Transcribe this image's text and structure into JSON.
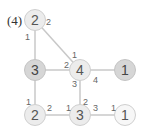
{
  "problem_label": "(4)",
  "nodes": [
    {
      "id": "top-left",
      "value": "2",
      "style": "light",
      "x": 35,
      "y": 20
    },
    {
      "id": "mid-left",
      "value": "3",
      "style": "dark",
      "x": 35,
      "y": 70
    },
    {
      "id": "center",
      "value": "4",
      "style": "light",
      "x": 80,
      "y": 70
    },
    {
      "id": "mid-right",
      "value": "1",
      "style": "dark",
      "x": 125,
      "y": 70
    },
    {
      "id": "bottom-left",
      "value": "2",
      "style": "light",
      "x": 35,
      "y": 115
    },
    {
      "id": "bottom-mid",
      "value": "3",
      "style": "light",
      "x": 80,
      "y": 115
    },
    {
      "id": "bottom-right",
      "value": "1",
      "style": "white",
      "x": 125,
      "y": 115
    }
  ],
  "edges": [
    {
      "from": "top-left",
      "to": "mid-left"
    },
    {
      "from": "top-left",
      "to": "center"
    },
    {
      "from": "mid-left",
      "to": "center"
    },
    {
      "from": "center",
      "to": "mid-right"
    },
    {
      "from": "mid-left",
      "to": "bottom-left"
    },
    {
      "from": "center",
      "to": "bottom-mid"
    },
    {
      "from": "bottom-left",
      "to": "bottom-mid"
    },
    {
      "from": "bottom-mid",
      "to": "bottom-right"
    }
  ],
  "edge_labels": [
    {
      "text": "2",
      "x": 46,
      "y": 18
    },
    {
      "text": "1",
      "x": 25,
      "y": 33
    },
    {
      "text": "1",
      "x": 72,
      "y": 51
    },
    {
      "text": "2",
      "x": 64,
      "y": 61
    },
    {
      "text": "4",
      "x": 93,
      "y": 76
    },
    {
      "text": "3",
      "x": 72,
      "y": 80
    },
    {
      "text": "1",
      "x": 26,
      "y": 98
    },
    {
      "text": "2",
      "x": 47,
      "y": 104
    },
    {
      "text": "1",
      "x": 66,
      "y": 104
    },
    {
      "text": "2",
      "x": 83,
      "y": 98
    },
    {
      "text": "3",
      "x": 93,
      "y": 104
    },
    {
      "text": "1",
      "x": 111,
      "y": 104
    }
  ],
  "colors": {
    "edge": "#c8c8c8",
    "node_light": "#ececec",
    "node_dark": "#d6d6d6",
    "text": "#555555"
  }
}
